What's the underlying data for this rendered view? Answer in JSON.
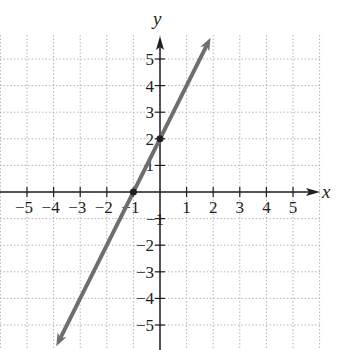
{
  "chart_data": {
    "type": "line",
    "title": "",
    "xlabel": "x",
    "ylabel": "y",
    "xlim": [
      -6,
      6
    ],
    "ylim": [
      -6,
      6
    ],
    "grid": true,
    "grid_style": "dotted",
    "x_ticks": [
      -5,
      -4,
      -3,
      -2,
      -1,
      1,
      2,
      3,
      4,
      5
    ],
    "y_ticks": [
      -5,
      -4,
      -3,
      -2,
      -1,
      1,
      2,
      3,
      4,
      5
    ],
    "x_tick_labels": [
      "−5",
      "−4",
      "−3",
      "−2",
      "−1",
      "1",
      "2",
      "3",
      "4",
      "5"
    ],
    "y_tick_labels": [
      "−5",
      "−4",
      "−3",
      "−2",
      "−1",
      "1",
      "2",
      "3",
      "4",
      "5"
    ],
    "series": [
      {
        "name": "y = 2x + 2",
        "equation": "y = 2x + 2",
        "slope": 2,
        "intercept": 2,
        "x": [
          -3.9,
          -1,
          0,
          1.9
        ],
        "y": [
          -5.8,
          0,
          2,
          5.8
        ],
        "arrows_both_ends": true,
        "marked_points": [
          {
            "x": -1,
            "y": 0
          },
          {
            "x": 0,
            "y": 2
          }
        ]
      }
    ],
    "colors": {
      "line": "#6d6e71",
      "axes": "#231f20",
      "grid": "#b5b5b5"
    }
  }
}
